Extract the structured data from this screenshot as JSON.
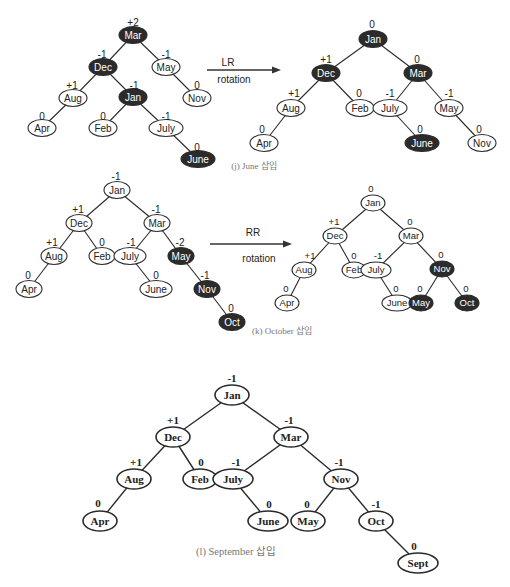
{
  "colors": {
    "dark_node": "#2b2b2b",
    "light_node": "#ffffff",
    "stroke": "#2b2b2b",
    "caption": "#777777"
  },
  "diagrams": [
    {
      "id": "j-before",
      "style": "sans",
      "rx": 14,
      "ry": 8.5,
      "font_size": 10,
      "bal_size": 10,
      "nodes": [
        {
          "id": "Mar",
          "label": "Mar",
          "x": 133,
          "y": 35,
          "dark": true,
          "bal": "+2",
          "bx": 133,
          "by": 22
        },
        {
          "id": "Dec",
          "label": "Dec",
          "x": 103,
          "y": 67,
          "dark": true,
          "bal": "-1",
          "bx": 102,
          "by": 54
        },
        {
          "id": "May",
          "label": "May",
          "x": 166,
          "y": 67,
          "dark": false,
          "bal": "-1",
          "bx": 166,
          "by": 54
        },
        {
          "id": "Aug",
          "label": "Aug",
          "x": 73,
          "y": 98,
          "dark": false,
          "bal": "+1",
          "bx": 72,
          "by": 85
        },
        {
          "id": "Jan",
          "label": "Jan",
          "x": 133,
          "y": 97,
          "dark": true,
          "bal": "-1",
          "bx": 134,
          "by": 85
        },
        {
          "id": "Nov",
          "label": "Nov",
          "x": 197,
          "y": 98,
          "dark": false,
          "bal": "0",
          "bx": 197,
          "by": 85
        },
        {
          "id": "Apr",
          "label": "Apr",
          "x": 42,
          "y": 128,
          "dark": false,
          "bal": "0",
          "bx": 42,
          "by": 116
        },
        {
          "id": "Feb",
          "label": "Feb",
          "x": 103,
          "y": 128,
          "dark": false,
          "bal": "0",
          "bx": 103,
          "by": 116
        },
        {
          "id": "July",
          "label": "July",
          "x": 166,
          "y": 128,
          "dark": false,
          "bal": "-1",
          "bx": 166,
          "by": 116
        },
        {
          "id": "June",
          "label": "June",
          "x": 198,
          "y": 159,
          "dark": true,
          "bal": "0",
          "bx": 197,
          "by": 147
        }
      ],
      "edges": [
        [
          "Mar",
          "Dec"
        ],
        [
          "Mar",
          "May"
        ],
        [
          "Dec",
          "Aug"
        ],
        [
          "Dec",
          "Jan"
        ],
        [
          "May",
          "Nov"
        ],
        [
          "Aug",
          "Apr"
        ],
        [
          "Jan",
          "Feb"
        ],
        [
          "Jan",
          "July"
        ],
        [
          "July",
          "June"
        ]
      ]
    },
    {
      "id": "j-after",
      "style": "sans",
      "rx": 14,
      "ry": 8.5,
      "font_size": 10,
      "bal_size": 10,
      "nodes": [
        {
          "id": "Jan",
          "label": "Jan",
          "x": 373,
          "y": 39,
          "dark": true,
          "bal": "0",
          "bx": 372,
          "by": 24
        },
        {
          "id": "Dec",
          "label": "Dec",
          "x": 326,
          "y": 73,
          "dark": true,
          "bal": "+1",
          "bx": 326,
          "by": 59
        },
        {
          "id": "Mar",
          "label": "Mar",
          "x": 418,
          "y": 73,
          "dark": true,
          "bal": "0",
          "bx": 417,
          "by": 59
        },
        {
          "id": "Aug",
          "label": "Aug",
          "x": 291,
          "y": 108,
          "dark": false,
          "bal": "+1",
          "bx": 294,
          "by": 93
        },
        {
          "id": "Feb",
          "label": "Feb",
          "x": 360,
          "y": 108,
          "dark": false,
          "bal": "0",
          "bx": 359,
          "by": 93
        },
        {
          "id": "July",
          "label": "July",
          "x": 390,
          "y": 108,
          "dark": false,
          "bal": "-1",
          "bx": 390,
          "by": 93
        },
        {
          "id": "May",
          "label": "May",
          "x": 449,
          "y": 108,
          "dark": false,
          "bal": "-1",
          "bx": 449,
          "by": 93
        },
        {
          "id": "Apr",
          "label": "Apr",
          "x": 264,
          "y": 143,
          "dark": false,
          "bal": "0",
          "bx": 262,
          "by": 129
        },
        {
          "id": "June",
          "label": "June",
          "x": 422,
          "y": 143,
          "dark": true,
          "bal": "0",
          "bx": 420,
          "by": 129
        },
        {
          "id": "Nov",
          "label": "Nov",
          "x": 482,
          "y": 143,
          "dark": false,
          "bal": "0",
          "bx": 479,
          "by": 129
        }
      ],
      "edges": [
        [
          "Jan",
          "Dec"
        ],
        [
          "Jan",
          "Mar"
        ],
        [
          "Dec",
          "Aug"
        ],
        [
          "Dec",
          "Feb"
        ],
        [
          "Mar",
          "July"
        ],
        [
          "Mar",
          "May"
        ],
        [
          "Aug",
          "Apr"
        ],
        [
          "July",
          "June"
        ],
        [
          "May",
          "Nov"
        ]
      ]
    },
    {
      "id": "k-before",
      "style": "sans",
      "rx": 13,
      "ry": 8.5,
      "font_size": 10,
      "bal_size": 10,
      "nodes": [
        {
          "id": "Jan",
          "label": "Jan",
          "x": 117,
          "y": 190,
          "dark": false,
          "bal": "-1",
          "bx": 116,
          "by": 176
        },
        {
          "id": "Dec",
          "label": "Dec",
          "x": 79,
          "y": 223,
          "dark": false,
          "bal": "+1",
          "bx": 78,
          "by": 209
        },
        {
          "id": "Mar",
          "label": "Mar",
          "x": 157,
          "y": 223,
          "dark": false,
          "bal": "-1",
          "bx": 156,
          "by": 209
        },
        {
          "id": "Aug",
          "label": "Aug",
          "x": 54,
          "y": 256,
          "dark": false,
          "bal": "+1",
          "bx": 52,
          "by": 242
        },
        {
          "id": "Feb",
          "label": "Feb",
          "x": 102,
          "y": 256,
          "dark": false,
          "bal": "0",
          "bx": 102,
          "by": 242
        },
        {
          "id": "July",
          "label": "July",
          "x": 130,
          "y": 256,
          "dark": false,
          "bal": "-1",
          "bx": 131,
          "by": 242
        },
        {
          "id": "May",
          "label": "May",
          "x": 181,
          "y": 256,
          "dark": true,
          "bal": "-2",
          "bx": 180,
          "by": 242
        },
        {
          "id": "Apr",
          "label": "Apr",
          "x": 29,
          "y": 289,
          "dark": false,
          "bal": "0",
          "bx": 28,
          "by": 275
        },
        {
          "id": "June",
          "label": "June",
          "x": 156,
          "y": 289,
          "dark": false,
          "bal": "0",
          "bx": 156,
          "by": 275
        },
        {
          "id": "Nov",
          "label": "Nov",
          "x": 207,
          "y": 289,
          "dark": true,
          "bal": "-1",
          "bx": 205,
          "by": 275
        },
        {
          "id": "Oct",
          "label": "Oct",
          "x": 232,
          "y": 322,
          "dark": true,
          "bal": "0",
          "bx": 231,
          "by": 308
        }
      ],
      "edges": [
        [
          "Jan",
          "Dec"
        ],
        [
          "Jan",
          "Mar"
        ],
        [
          "Dec",
          "Aug"
        ],
        [
          "Dec",
          "Feb"
        ],
        [
          "Mar",
          "July"
        ],
        [
          "Mar",
          "May"
        ],
        [
          "Aug",
          "Apr"
        ],
        [
          "July",
          "June"
        ],
        [
          "May",
          "Nov"
        ],
        [
          "Nov",
          "Oct"
        ]
      ]
    },
    {
      "id": "k-after",
      "style": "sans",
      "rx": 12,
      "ry": 8,
      "font_size": 9.5,
      "bal_size": 9.5,
      "nodes": [
        {
          "id": "Jan",
          "label": "Jan",
          "x": 373,
          "y": 203,
          "dark": false,
          "bal": "0",
          "bx": 371,
          "by": 189
        },
        {
          "id": "Dec",
          "label": "Dec",
          "x": 335,
          "y": 236,
          "dark": false,
          "bal": "+1",
          "bx": 334,
          "by": 222
        },
        {
          "id": "Mar",
          "label": "Mar",
          "x": 411,
          "y": 236,
          "dark": false,
          "bal": "0",
          "bx": 410,
          "by": 222
        },
        {
          "id": "Aug",
          "label": "Aug",
          "x": 304,
          "y": 270,
          "dark": false,
          "bal": "+1",
          "bx": 310,
          "by": 256
        },
        {
          "id": "Feb",
          "label": "Feb",
          "x": 354,
          "y": 270,
          "dark": false,
          "bal": "0",
          "bx": 354,
          "by": 256
        },
        {
          "id": "July",
          "label": "July",
          "x": 376,
          "y": 270,
          "dark": false,
          "bal": "-1",
          "bx": 378,
          "by": 256
        },
        {
          "id": "Nov",
          "label": "Nov",
          "x": 442,
          "y": 269,
          "dark": true,
          "bal": "0",
          "bx": 441,
          "by": 255
        },
        {
          "id": "Apr",
          "label": "Apr",
          "x": 287,
          "y": 303,
          "dark": false,
          "bal": "0",
          "bx": 286,
          "by": 289
        },
        {
          "id": "June",
          "label": "June",
          "x": 397,
          "y": 303,
          "dark": false,
          "bal": "0",
          "bx": 396,
          "by": 289
        },
        {
          "id": "May",
          "label": "May",
          "x": 421,
          "y": 303,
          "dark": true,
          "bal": "0",
          "bx": 420,
          "by": 289
        },
        {
          "id": "Oct",
          "label": "Oct",
          "x": 467,
          "y": 303,
          "dark": true,
          "bal": "0",
          "bx": 466,
          "by": 289
        }
      ],
      "edges": [
        [
          "Jan",
          "Dec"
        ],
        [
          "Jan",
          "Mar"
        ],
        [
          "Dec",
          "Aug"
        ],
        [
          "Dec",
          "Feb"
        ],
        [
          "Mar",
          "July"
        ],
        [
          "Mar",
          "Nov"
        ],
        [
          "Aug",
          "Apr"
        ],
        [
          "July",
          "June"
        ],
        [
          "Nov",
          "May"
        ],
        [
          "Nov",
          "Oct"
        ]
      ]
    },
    {
      "id": "l",
      "style": "serif",
      "rx": 17,
      "ry": 10,
      "font_size": 11,
      "bal_size": 11,
      "nodes": [
        {
          "id": "Jan",
          "label": "Jan",
          "x": 232,
          "y": 395,
          "dark": false,
          "bal": "-1",
          "bx": 232,
          "by": 378
        },
        {
          "id": "Dec",
          "label": "Dec",
          "x": 173,
          "y": 437,
          "dark": false,
          "bal": "+1",
          "bx": 173,
          "by": 420
        },
        {
          "id": "Mar",
          "label": "Mar",
          "x": 291,
          "y": 437,
          "dark": false,
          "bal": "-1",
          "bx": 289,
          "by": 420
        },
        {
          "id": "Aug",
          "label": "Aug",
          "x": 134,
          "y": 479,
          "dark": false,
          "bal": "+1",
          "bx": 136,
          "by": 462
        },
        {
          "id": "Feb",
          "label": "Feb",
          "x": 200,
          "y": 479,
          "dark": false,
          "bal": "0",
          "bx": 201,
          "by": 462
        },
        {
          "id": "July",
          "label": "July",
          "x": 233,
          "y": 479,
          "dark": false,
          "bal": "-1",
          "bx": 236,
          "by": 462
        },
        {
          "id": "Nov",
          "label": "Nov",
          "x": 341,
          "y": 479,
          "dark": false,
          "bal": "-1",
          "bx": 339,
          "by": 462
        },
        {
          "id": "Apr",
          "label": "Apr",
          "x": 100,
          "y": 521,
          "dark": false,
          "bal": "0",
          "bx": 98,
          "by": 503
        },
        {
          "id": "June",
          "label": "June",
          "x": 268,
          "y": 521,
          "dark": false,
          "bal": "0",
          "bx": 269,
          "by": 504
        },
        {
          "id": "May",
          "label": "May",
          "x": 308,
          "y": 521,
          "dark": false,
          "bal": "0",
          "bx": 307,
          "by": 504
        },
        {
          "id": "Oct",
          "label": "Oct",
          "x": 376,
          "y": 521,
          "dark": false,
          "bal": "-1",
          "bx": 376,
          "by": 504
        },
        {
          "id": "Sept",
          "label": "Sept",
          "x": 418,
          "y": 563,
          "dark": false,
          "bal": "0",
          "bx": 414,
          "by": 546
        }
      ],
      "edges": [
        [
          "Jan",
          "Dec"
        ],
        [
          "Jan",
          "Mar"
        ],
        [
          "Dec",
          "Aug"
        ],
        [
          "Dec",
          "Feb"
        ],
        [
          "Mar",
          "July"
        ],
        [
          "Mar",
          "Nov"
        ],
        [
          "Aug",
          "Apr"
        ],
        [
          "July",
          "June"
        ],
        [
          "Nov",
          "May"
        ],
        [
          "Nov",
          "Oct"
        ],
        [
          "Oct",
          "Sept"
        ]
      ]
    }
  ],
  "arrows": [
    {
      "id": "lr-arrow",
      "x1": 207,
      "x2": 281,
      "y": 70,
      "top_label": "LR",
      "bottom_label": "rotation",
      "tx": 228,
      "ty": 66,
      "bx": 234,
      "by": 83
    },
    {
      "id": "rr-arrow",
      "x1": 210,
      "x2": 292,
      "y": 244,
      "top_label": "RR",
      "bottom_label": "rotation",
      "tx": 253,
      "ty": 236,
      "bx": 259,
      "by": 262
    }
  ],
  "captions": [
    {
      "id": "caption-j",
      "text": "(j) June 삽입",
      "x": 254,
      "y": 169,
      "size": 9
    },
    {
      "id": "caption-k",
      "text": "(k) October 삽입",
      "x": 282,
      "y": 334,
      "size": 9
    },
    {
      "id": "caption-l",
      "text": "(l) September 삽입",
      "x": 236,
      "y": 555,
      "size": 10.5
    }
  ]
}
